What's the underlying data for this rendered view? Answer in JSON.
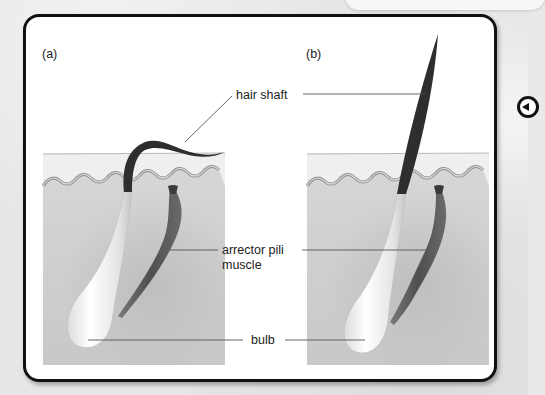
{
  "figure": {
    "panels": [
      {
        "id": "a",
        "label": "(a)",
        "state": "hair lying flat, arrector pili muscle relaxed"
      },
      {
        "id": "b",
        "label": "(b)",
        "state": "hair standing erect, arrector pili muscle contracted"
      }
    ],
    "annotations": {
      "hair_shaft": "hair shaft",
      "arrector_line1": "arrector pili",
      "arrector_line2": "muscle",
      "bulb": "bulb"
    },
    "colors": {
      "card_border": "#111111",
      "skin_dermis": "#cfcfcf",
      "epidermis_edge": "#9a9a9a",
      "hair": "#2e2e2e",
      "muscle": "#5a5a5a",
      "bulb": "#f2f2f2"
    }
  },
  "navigation": {
    "prev_icon": "circle-arrow-left-icon"
  }
}
